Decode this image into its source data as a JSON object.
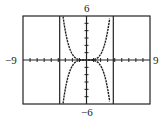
{
  "chart_data": {
    "type": "line",
    "title": "",
    "xlabel": "",
    "ylabel": "",
    "xlim": [
      -9,
      9
    ],
    "ylim": [
      -6,
      6
    ],
    "x_tick_step": 1,
    "y_tick_step": 1,
    "grid": false,
    "window_labels": {
      "xmin": "−9",
      "xmax": "9",
      "ymax": "6",
      "ymin": "−6"
    },
    "series": [
      {
        "name": "upper curve",
        "x": [
          -3.3,
          -3.0,
          -2.5,
          -2.0,
          -1.5,
          -1.0,
          -0.5,
          0,
          0.5,
          1.0,
          1.5,
          2.0,
          2.5,
          3.0,
          3.3
        ],
        "y": [
          5.9,
          4.05,
          1.95,
          0.8,
          0.25,
          0.05,
          0.0,
          0,
          0.0,
          0.05,
          0.25,
          0.8,
          1.95,
          4.05,
          5.9
        ]
      },
      {
        "name": "lower curve",
        "x": [
          -3.3,
          -3.0,
          -2.5,
          -2.0,
          -1.5,
          -1.0,
          -0.5,
          0,
          0.5,
          1.0,
          1.5,
          2.0,
          2.5,
          3.0,
          3.3
        ],
        "y": [
          -5.9,
          -4.05,
          -1.95,
          -0.8,
          -0.25,
          -0.05,
          0.0,
          0,
          0.0,
          -0.05,
          -0.25,
          -0.8,
          -1.95,
          -4.05,
          -5.9
        ]
      }
    ],
    "vertical_lines_x": [
      -3.8,
      3.8
    ]
  }
}
